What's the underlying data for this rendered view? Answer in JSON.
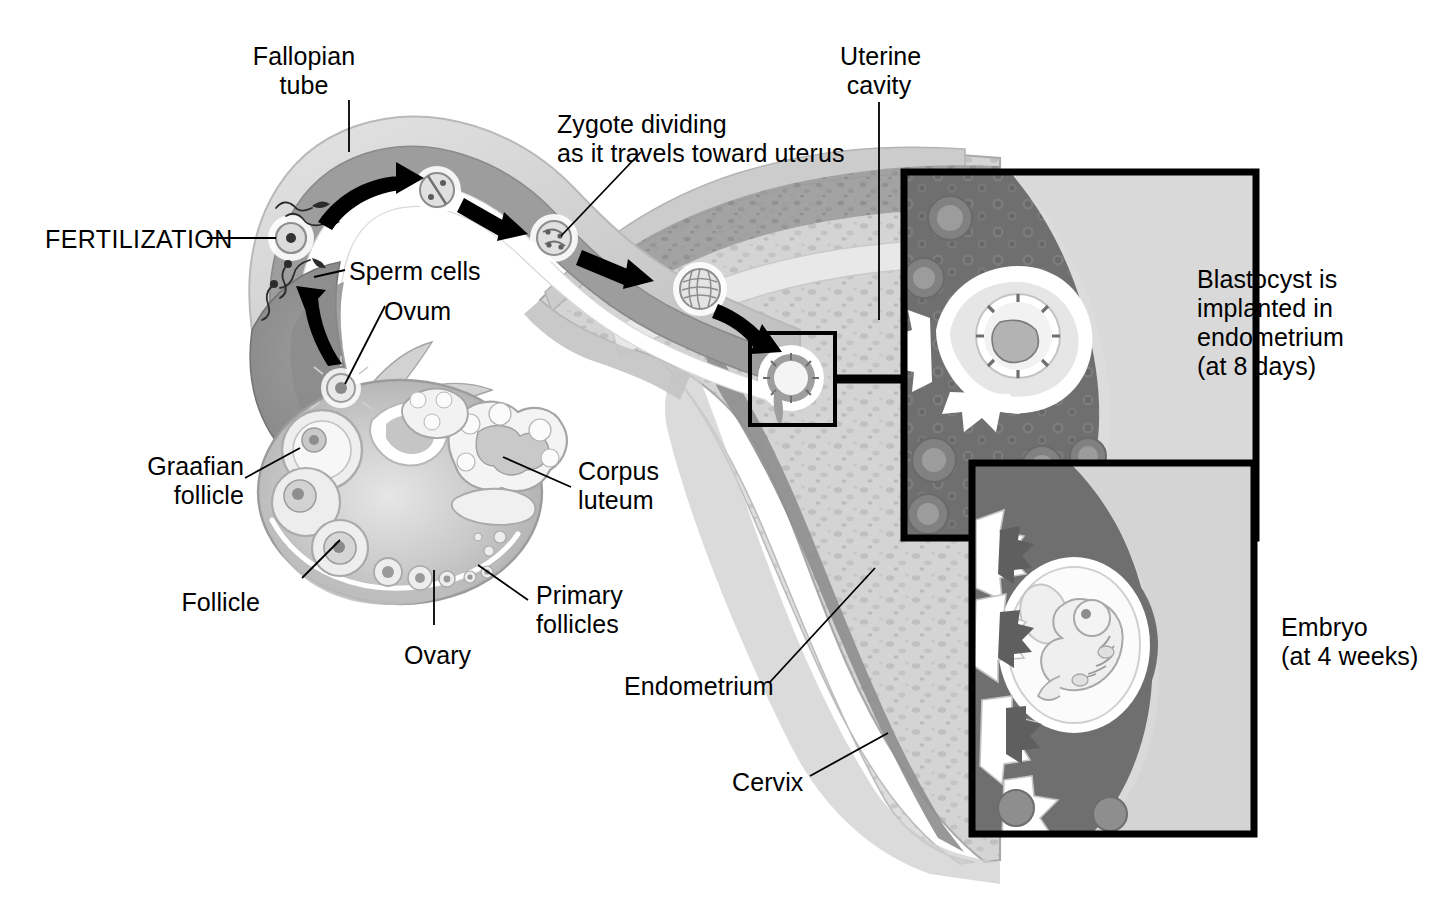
{
  "figure": {
    "type": "anatomical-illustration",
    "width": 1436,
    "height": 897,
    "background_color": "#ffffff",
    "ink_color": "#000000",
    "palette": {
      "outer_serosa": "#d7d7d7",
      "tube_muscle": "#9d9d9d",
      "tube_muscle_dark": "#8a8a8a",
      "tube_lumen": "#ffffff",
      "myometrium_light": "#d2d2d2",
      "myometrium_mid": "#bdbdbd",
      "endometrium_band": "#8f8f8f",
      "ovary_stroma": "#c6c6c6",
      "ovary_cortex": "#b0b0b0",
      "follicle_fluid": "#ededed",
      "inset_dark_tissue": "#6f6f6f",
      "inset_light_tissue": "#d9d9d9",
      "inset_border": "#000000"
    }
  },
  "labels": [
    {
      "id": "fallopian-tube",
      "text": "Fallopian\ntube",
      "x": 304,
      "y": 42,
      "align": "center"
    },
    {
      "id": "zygote-dividing",
      "text": "Zygote dividing\nas it travels toward uterus",
      "x": 557,
      "y": 110,
      "align": "left"
    },
    {
      "id": "uterine-cavity",
      "text": "Uterine\ncavity",
      "x": 845,
      "y": 42,
      "align": "left"
    },
    {
      "id": "fertilization",
      "text": "FERTILIZATION",
      "x": 45,
      "y": 225,
      "align": "left"
    },
    {
      "id": "sperm-cells",
      "text": "Sperm cells",
      "x": 349,
      "y": 257,
      "align": "left"
    },
    {
      "id": "ovum",
      "text": "Ovum",
      "x": 384,
      "y": 297,
      "align": "left"
    },
    {
      "id": "graafian-follicle",
      "text": "Graafian\nfollicle",
      "x": 236,
      "y": 452,
      "align": "right"
    },
    {
      "id": "corpus-luteum",
      "text": "Corpus\nluteum",
      "x": 578,
      "y": 457,
      "align": "left"
    },
    {
      "id": "follicle",
      "text": "Follicle",
      "x": 258,
      "y": 588,
      "align": "right"
    },
    {
      "id": "primary-follicles",
      "text": "Primary\nfollicles",
      "x": 536,
      "y": 581,
      "align": "left"
    },
    {
      "id": "ovary",
      "text": "Ovary",
      "x": 404,
      "y": 641,
      "align": "left"
    },
    {
      "id": "endometrium",
      "text": "Endometrium",
      "x": 624,
      "y": 672,
      "align": "left"
    },
    {
      "id": "cervix",
      "text": "Cervix",
      "x": 732,
      "y": 768,
      "align": "left"
    },
    {
      "id": "blastocyst-implanted",
      "text": "Blastocyst is\nimplanted in\nendometrium\n(at 8 days)",
      "x": 1197,
      "y": 265,
      "align": "left"
    },
    {
      "id": "embryo-4-weeks",
      "text": "Embryo\n(at 4 weeks)",
      "x": 1281,
      "y": 613,
      "align": "left"
    }
  ],
  "insets": [
    {
      "id": "blastocyst-inset",
      "caption_id": "blastocyst-implanted",
      "x": 904,
      "y": 172,
      "width": 352,
      "height": 366,
      "border_width": 7
    },
    {
      "id": "embryo-inset",
      "caption_id": "embryo-4-weeks",
      "x": 972,
      "y": 463,
      "width": 282,
      "height": 371,
      "border_width": 7
    },
    {
      "id": "implantation-callout-box",
      "caption_id": null,
      "x": 750,
      "y": 333,
      "width": 85,
      "height": 92,
      "border_width": 4
    }
  ],
  "stages": [
    {
      "id": "ovum-released",
      "label": "Ovum",
      "x": 341,
      "y": 388
    },
    {
      "id": "fertilization-site",
      "label": "FERTILIZATION",
      "x": 291,
      "y": 238
    },
    {
      "id": "two-cell-stage",
      "label": "Zygote (2-cell)",
      "x": 437,
      "y": 190
    },
    {
      "id": "four-cell-stage",
      "label": "Zygote (4-cell)",
      "x": 554,
      "y": 238
    },
    {
      "id": "morula-stage",
      "label": "Morula",
      "x": 700,
      "y": 289
    },
    {
      "id": "blastocyst-implanted",
      "label": "Implanted blastocyst",
      "x": 791,
      "y": 378
    }
  ],
  "arrows": [
    {
      "id": "arrow-ovum-to-fertilization",
      "from": "ovum-released",
      "to": "fertilization-site"
    },
    {
      "id": "arrow-fertilization-to-2cell",
      "from": "fertilization-site",
      "to": "two-cell-stage"
    },
    {
      "id": "arrow-2cell-to-4cell",
      "from": "two-cell-stage",
      "to": "four-cell-stage"
    },
    {
      "id": "arrow-4cell-to-morula",
      "from": "four-cell-stage",
      "to": "morula-stage"
    },
    {
      "id": "arrow-morula-to-implant",
      "from": "morula-stage",
      "to": "blastocyst-implanted"
    }
  ],
  "structures": [
    "Fallopian tube",
    "Ovary",
    "Graafian follicle",
    "Follicle",
    "Primary follicles",
    "Corpus luteum",
    "Uterine cavity",
    "Endometrium",
    "Cervix",
    "Sperm cells",
    "Ovum"
  ]
}
